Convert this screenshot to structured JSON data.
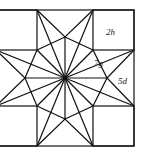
{
  "diagram": {
    "type": "eight-pointed star quilt block",
    "labels": [
      {
        "id": "2h",
        "text": "2h",
        "x": 110,
        "y": 35
      },
      {
        "id": "7g",
        "text": "7g",
        "x": 96,
        "y": 65
      },
      {
        "id": "5d",
        "text": "5d",
        "x": 119,
        "y": 83
      }
    ],
    "colors": {
      "stroke": "#111111",
      "background": "#ffffff"
    }
  }
}
